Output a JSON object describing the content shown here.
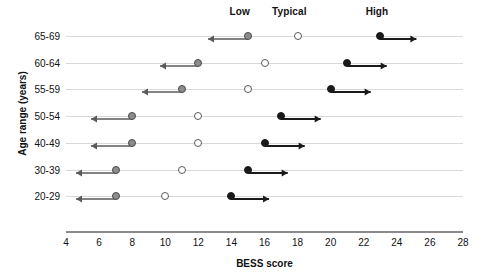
{
  "chart_data": {
    "type": "scatter",
    "title": "",
    "xlabel": "BESS score",
    "ylabel": "Age range (years)",
    "xlim": [
      4,
      28
    ],
    "xticks": [
      4,
      6,
      8,
      10,
      12,
      14,
      16,
      18,
      20,
      22,
      24,
      26,
      28
    ],
    "grid": true,
    "legend_position": "top",
    "band_labels": [
      {
        "label": "Low",
        "x": 14.5
      },
      {
        "label": "Typical",
        "x": 17.5
      },
      {
        "label": "High",
        "x": 22.8
      }
    ],
    "series": [
      {
        "name": "Low",
        "marker": "gray-filled-circle",
        "arrow": "left"
      },
      {
        "name": "Typical",
        "marker": "open-circle",
        "arrow": "none"
      },
      {
        "name": "High",
        "marker": "black-filled-circle",
        "arrow": "right"
      }
    ],
    "categories": [
      "65-69",
      "60-64",
      "55-59",
      "50-54",
      "40-49",
      "30-39",
      "20-29"
    ],
    "rows": [
      {
        "category": "65-69",
        "low": 15,
        "low_arrow_end": 12.6,
        "typical": 18,
        "high": 23,
        "high_arrow_end": 25.2
      },
      {
        "category": "60-64",
        "low": 12,
        "low_arrow_end": 9.7,
        "typical": 16,
        "high": 21,
        "high_arrow_end": 23.4
      },
      {
        "category": "55-59",
        "low": 11,
        "low_arrow_end": 8.6,
        "typical": 15,
        "high": 20,
        "high_arrow_end": 22.4
      },
      {
        "category": "50-54",
        "low": 8,
        "low_arrow_end": 5.5,
        "typical": 12,
        "high": 17,
        "high_arrow_end": 19.4
      },
      {
        "category": "40-49",
        "low": 8,
        "low_arrow_end": 5.5,
        "typical": 12,
        "high": 16,
        "high_arrow_end": 18.4
      },
      {
        "category": "30-39",
        "low": 7,
        "low_arrow_end": 4.6,
        "typical": 11,
        "high": 15,
        "high_arrow_end": 17.4
      },
      {
        "category": "20-29",
        "low": 7,
        "low_arrow_end": 4.6,
        "typical": 10,
        "high": 14,
        "high_arrow_end": 16.3
      }
    ]
  },
  "colors": {
    "low_marker": "#8c8c8c",
    "typical_marker": "#ffffff",
    "high_marker": "#1a1a1a",
    "gridline": "#d8d8d8",
    "axis": "#8a8a8a",
    "text": "#111111"
  }
}
